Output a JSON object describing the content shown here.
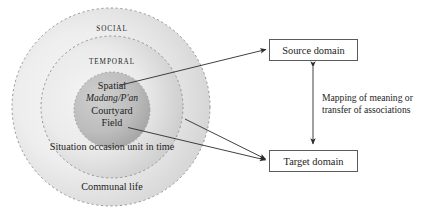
{
  "diagram": {
    "rings": [
      {
        "id": "social",
        "label": "SOCIAL"
      },
      {
        "id": "temporal",
        "label": "TEMPORAL"
      }
    ],
    "core": {
      "line1": "Spatial",
      "line2": "Madang/P'an",
      "line3": "Courtyard",
      "line4": "Field"
    },
    "ring_notes": {
      "temporal_note": "Situation occasion unit in time",
      "social_note": "Communal life"
    },
    "boxes": [
      {
        "id": "source",
        "label": "Source domain"
      },
      {
        "id": "target",
        "label": "Target domain"
      }
    ],
    "mapping_note": "Mapping of meaning or transfer of associations",
    "colors": {
      "ring_stroke": "#8c8c8c",
      "core_fill_light": "#c9c9c9",
      "core_fill_dark": "#a6a6a6",
      "band_fill": "#e8e8e8",
      "arrow": "#2b2b2b",
      "box_border": "#5b5b5b",
      "text": "#1d1d1d",
      "background": "#ffffff"
    }
  }
}
